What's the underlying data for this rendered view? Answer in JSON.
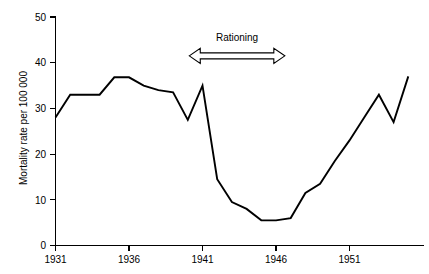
{
  "chart_data": {
    "type": "line",
    "title": "",
    "subtitle": "",
    "xlabel": "",
    "ylabel": "Mortality rate per 100 000",
    "xlim": [
      1931,
      1955
    ],
    "ylim": [
      0,
      50
    ],
    "grid": false,
    "legend": null,
    "x_tick_labels": [
      "1931",
      "1936",
      "1941",
      "1946",
      "1951"
    ],
    "x_tick_values": [
      1931,
      1936,
      1941,
      1946,
      1951
    ],
    "y_tick_labels": [
      "0",
      "10",
      "20",
      "30",
      "40",
      "50"
    ],
    "y_tick_values": [
      0,
      10,
      20,
      30,
      40,
      50
    ],
    "x": [
      1931,
      1932,
      1933,
      1934,
      1935,
      1936,
      1937,
      1938,
      1939,
      1940,
      1941,
      1942,
      1943,
      1944,
      1945,
      1946,
      1947,
      1948,
      1949,
      1950,
      1951,
      1952,
      1953,
      1954,
      1955
    ],
    "values": [
      28,
      33,
      33,
      33,
      36.8,
      36.8,
      35,
      34,
      33.5,
      27.5,
      35,
      14.5,
      9.5,
      8,
      5.5,
      5.5,
      6,
      11.5,
      13.5,
      18.5,
      23,
      28,
      33,
      27,
      37
    ],
    "series": [
      {
        "name": "Mortality rate",
        "values": [
          28,
          33,
          33,
          33,
          36.8,
          36.8,
          35,
          34,
          33.5,
          27.5,
          35,
          14.5,
          9.5,
          8,
          5.5,
          5.5,
          6,
          11.5,
          13.5,
          18.5,
          23,
          28,
          33,
          27,
          37
        ]
      }
    ],
    "annotations": [
      {
        "label": "Rationing",
        "type": "double-headed-arrow",
        "x_start": 1940.1,
        "x_end": 1946.6,
        "y": 41.5
      }
    ],
    "colors": {
      "line": "#000000",
      "axis": "#000000",
      "background": "#ffffff"
    }
  }
}
